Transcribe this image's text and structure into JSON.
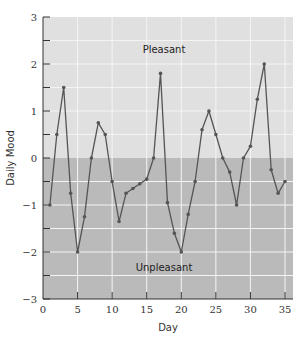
{
  "chart_data": {
    "type": "line",
    "title": "",
    "xlabel": "Day",
    "ylabel": "Daily Mood",
    "xlim": [
      0,
      36
    ],
    "ylim": [
      -3,
      3
    ],
    "x_ticks": [
      0,
      5,
      10,
      15,
      20,
      25,
      30,
      35
    ],
    "y_ticks": [
      -3,
      -2,
      -1,
      0,
      1,
      2,
      3
    ],
    "grid": true,
    "legend": null,
    "annotations": [
      {
        "text": "Pleasant",
        "x": 17.5,
        "y": 2.3
      },
      {
        "text": "Unpleasant",
        "x": 17.5,
        "y": -2.35
      }
    ],
    "regions": [
      {
        "name": "Pleasant",
        "from": 0,
        "to": 3,
        "color": "#e0e0e0"
      },
      {
        "name": "Unpleasant",
        "from": -3,
        "to": 0,
        "color": "#bababa"
      }
    ],
    "series": [
      {
        "name": "Daily Mood",
        "color": "#555555",
        "x": [
          1,
          2,
          3,
          4,
          5,
          6,
          7,
          8,
          9,
          10,
          11,
          12,
          13,
          14,
          15,
          16,
          17,
          18,
          19,
          20,
          21,
          22,
          23,
          24,
          25,
          26,
          27,
          28,
          29,
          30,
          31,
          32,
          33,
          34,
          35
        ],
        "values": [
          -1.0,
          0.5,
          1.5,
          -0.75,
          -2.0,
          -1.25,
          0.0,
          0.75,
          0.5,
          -0.5,
          -1.35,
          -0.75,
          -0.65,
          -0.55,
          -0.45,
          0.0,
          1.8,
          -0.95,
          -1.6,
          -2.0,
          -1.2,
          -0.5,
          0.6,
          1.0,
          0.5,
          0.0,
          -0.3,
          -1.0,
          0.0,
          0.25,
          1.25,
          2.0,
          -0.25,
          -0.75,
          -0.5
        ]
      }
    ]
  }
}
